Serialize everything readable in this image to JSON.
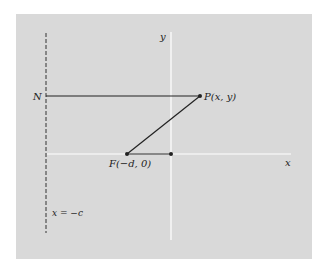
{
  "diagram": {
    "background_color": "#d9d9d9",
    "axis_color": "#ffffff",
    "line_color": "#222222",
    "labels": {
      "y_axis": "y",
      "x_axis": "x",
      "point_N": "N",
      "point_P": "P(x, y)",
      "point_F": "F(−d, 0)",
      "directrix": "x = −c"
    }
  }
}
